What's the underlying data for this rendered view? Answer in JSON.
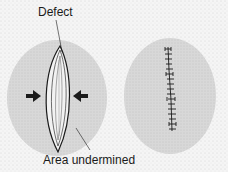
{
  "diagram": {
    "labels": {
      "defect": "Defect",
      "area_undermined": "Area undermined"
    },
    "panels": [
      {
        "name": "before-closure",
        "elements": [
          "lens-shaped defect",
          "undermined area",
          "compression arrows"
        ]
      },
      {
        "name": "after-closure",
        "elements": [
          "sutured line",
          "undermined area"
        ]
      }
    ],
    "colors": {
      "background_stipple": "#f4f4f4",
      "undermined_area": "#d6d6d6",
      "ink": "#1a1a1a"
    }
  }
}
